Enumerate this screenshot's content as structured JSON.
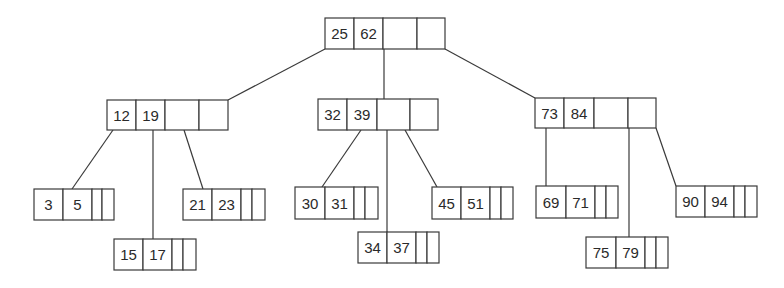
{
  "diagram": {
    "type": "b-tree",
    "colors": {
      "line": "#3a3a3a",
      "text": "#2a2a2a",
      "background": "#ffffff"
    },
    "nodes": [
      {
        "id": "root",
        "keys": [
          "25",
          "62"
        ],
        "x": 325,
        "y": 18,
        "h": 31,
        "cells": [
          29,
          29,
          34,
          28
        ]
      },
      {
        "id": "n1",
        "keys": [
          "12",
          "19"
        ],
        "x": 107,
        "y": 100,
        "h": 30,
        "cells": [
          29,
          29,
          34,
          29
        ]
      },
      {
        "id": "n2",
        "keys": [
          "32",
          "39"
        ],
        "x": 318,
        "y": 99,
        "h": 31,
        "cells": [
          29,
          30,
          33,
          28
        ]
      },
      {
        "id": "n3",
        "keys": [
          "73",
          "84"
        ],
        "x": 535,
        "y": 98,
        "h": 30,
        "cells": [
          29,
          30,
          34,
          28
        ]
      },
      {
        "id": "l1",
        "keys": [
          "3",
          "5"
        ],
        "x": 34,
        "y": 189,
        "h": 31,
        "cells": [
          29,
          29,
          10,
          12
        ]
      },
      {
        "id": "l2",
        "keys": [
          "15",
          "17"
        ],
        "x": 114,
        "y": 239,
        "h": 31,
        "cells": [
          29,
          29,
          11,
          13
        ]
      },
      {
        "id": "l3",
        "keys": [
          "21",
          "23"
        ],
        "x": 183,
        "y": 189,
        "h": 31,
        "cells": [
          29,
          29,
          11,
          13
        ]
      },
      {
        "id": "l4",
        "keys": [
          "30",
          "31"
        ],
        "x": 295,
        "y": 187,
        "h": 32,
        "cells": [
          30,
          29,
          11,
          13
        ]
      },
      {
        "id": "l5",
        "keys": [
          "34",
          "37"
        ],
        "x": 358,
        "y": 232,
        "h": 31,
        "cells": [
          29,
          29,
          11,
          12
        ]
      },
      {
        "id": "l6",
        "keys": [
          "45",
          "51"
        ],
        "x": 432,
        "y": 187,
        "h": 32,
        "cells": [
          29,
          29,
          11,
          12
        ]
      },
      {
        "id": "l7",
        "keys": [
          "69",
          "71"
        ],
        "x": 536,
        "y": 186,
        "h": 32,
        "cells": [
          30,
          29,
          11,
          12
        ]
      },
      {
        "id": "l8",
        "keys": [
          "75",
          "79"
        ],
        "x": 586,
        "y": 237,
        "h": 31,
        "cells": [
          30,
          29,
          11,
          12
        ]
      },
      {
        "id": "l9",
        "keys": [
          "90",
          "94"
        ],
        "x": 676,
        "y": 186,
        "h": 31,
        "cells": [
          29,
          29,
          11,
          12
        ]
      }
    ],
    "edges": [
      {
        "from": "root",
        "to": "n1",
        "x1": 325,
        "y1": 49,
        "x2": 228,
        "y2": 100
      },
      {
        "from": "root",
        "to": "n2",
        "x1": 384,
        "y1": 49,
        "x2": 384,
        "y2": 99
      },
      {
        "from": "root",
        "to": "n3",
        "x1": 445,
        "y1": 49,
        "x2": 535,
        "y2": 98
      },
      {
        "from": "n1",
        "to": "l1",
        "x1": 113,
        "y1": 130,
        "x2": 72,
        "y2": 189
      },
      {
        "from": "n1",
        "to": "l2",
        "x1": 153,
        "y1": 130,
        "x2": 153,
        "y2": 239
      },
      {
        "from": "n1",
        "to": "l3",
        "x1": 184,
        "y1": 130,
        "x2": 203,
        "y2": 189
      },
      {
        "from": "n2",
        "to": "l4",
        "x1": 361,
        "y1": 130,
        "x2": 322,
        "y2": 187
      },
      {
        "from": "n2",
        "to": "l5",
        "x1": 387,
        "y1": 130,
        "x2": 387,
        "y2": 232
      },
      {
        "from": "n2",
        "to": "l6",
        "x1": 405,
        "y1": 130,
        "x2": 437,
        "y2": 187
      },
      {
        "from": "n3",
        "to": "l7",
        "x1": 546,
        "y1": 128,
        "x2": 546,
        "y2": 186
      },
      {
        "from": "n3",
        "to": "l8",
        "x1": 629,
        "y1": 128,
        "x2": 629,
        "y2": 237
      },
      {
        "from": "n3",
        "to": "l9",
        "x1": 656,
        "y1": 128,
        "x2": 676,
        "y2": 186
      }
    ]
  }
}
